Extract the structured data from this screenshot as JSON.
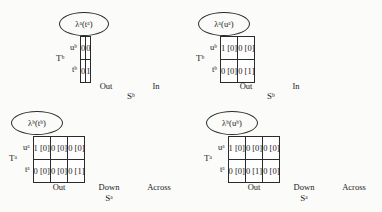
{
  "figure": {
    "background_color": "#fbfbf9",
    "ink_color": "#1a1a1a",
    "border_color": "#2b2b2b"
  },
  "panels": [
    {
      "id": "lambda-a-ta",
      "ellipse_label": "λᵃ(tᵃ)",
      "ellipse_label_plain": "lambda^a(t^a)",
      "row_group_label": "Tᵇ",
      "row_group_label_plain": "T^b",
      "row_labels": [
        "uᵇ",
        "tᵇ"
      ],
      "row_labels_plain": [
        "u^b",
        "t^b"
      ],
      "col_headers": [
        "Out",
        "In"
      ],
      "axis_label": "Sᵇ",
      "axis_label_plain": "S^b",
      "cells": [
        [
          "0",
          "0"
        ],
        [
          "0",
          "1"
        ]
      ]
    },
    {
      "id": "lambda-a-ua",
      "ellipse_label": "λᵃ(uᵃ)",
      "ellipse_label_plain": "lambda^a(u^a)",
      "row_group_label": "Tᵇ",
      "row_group_label_plain": "T^b",
      "row_labels": [
        "uᵇ",
        "tᵇ"
      ],
      "row_labels_plain": [
        "u^b",
        "t^b"
      ],
      "col_headers": [
        "Out",
        "In"
      ],
      "axis_label": "Sᵇ",
      "axis_label_plain": "S^b",
      "cells": [
        [
          "1 [0]",
          "0 [0]"
        ],
        [
          "0 [0]",
          "0 [1]"
        ]
      ]
    },
    {
      "id": "lambda-b-tb",
      "ellipse_label": "λᵇ(tᵇ)",
      "ellipse_label_plain": "lambda^b(t^b)",
      "row_group_label": "Tᵃ",
      "row_group_label_plain": "T^a",
      "row_labels": [
        "uᵃ",
        "tᵃ"
      ],
      "row_labels_plain": [
        "u^a",
        "t^a"
      ],
      "col_headers": [
        "Out",
        "Down",
        "Across"
      ],
      "axis_label": "Sᵃ",
      "axis_label_plain": "S^a",
      "cells": [
        [
          "1 [0]",
          "0 [0]",
          "0 [0]"
        ],
        [
          "0 [0]",
          "0 [0]",
          "0 [1]"
        ]
      ]
    },
    {
      "id": "lambda-b-ub",
      "ellipse_label": "λᵇ(uᵇ)",
      "ellipse_label_plain": "lambda^b(u^b)",
      "row_group_label": "Tᵃ",
      "row_group_label_plain": "T^a",
      "row_labels": [
        "uᵃ",
        "tᵃ"
      ],
      "row_labels_plain": [
        "u^a",
        "t^a"
      ],
      "col_headers": [
        "Out",
        "Down",
        "Across"
      ],
      "axis_label": "Sᵃ",
      "axis_label_plain": "S^a",
      "cells": [
        [
          "1 [0]",
          "0 [0]",
          "0 [0]"
        ],
        [
          "0 [0]",
          "0 [1]",
          "0 [0]"
        ]
      ]
    }
  ]
}
